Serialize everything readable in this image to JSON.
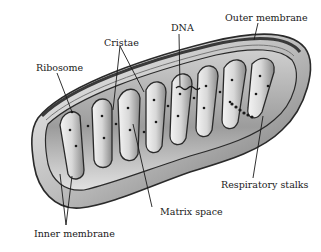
{
  "diagram": {
    "labels": {
      "cristae": "Cristae",
      "dna": "DNA",
      "outer_membrane": "Outer membrane",
      "ribosome": "Ribosome",
      "respiratory_stalks": "Respiratory stalks",
      "matrix_space": "Matrix space",
      "inner_membrane": "Inner membrane"
    },
    "colors": {
      "outline": "#2a2a2a",
      "body_shade": "#9a9a9a",
      "body_light": "#e6e6e6",
      "matrix_dark": "#6e6e6e",
      "dots": "#1a1a1a",
      "label_text": "#1a1a1a"
    }
  }
}
